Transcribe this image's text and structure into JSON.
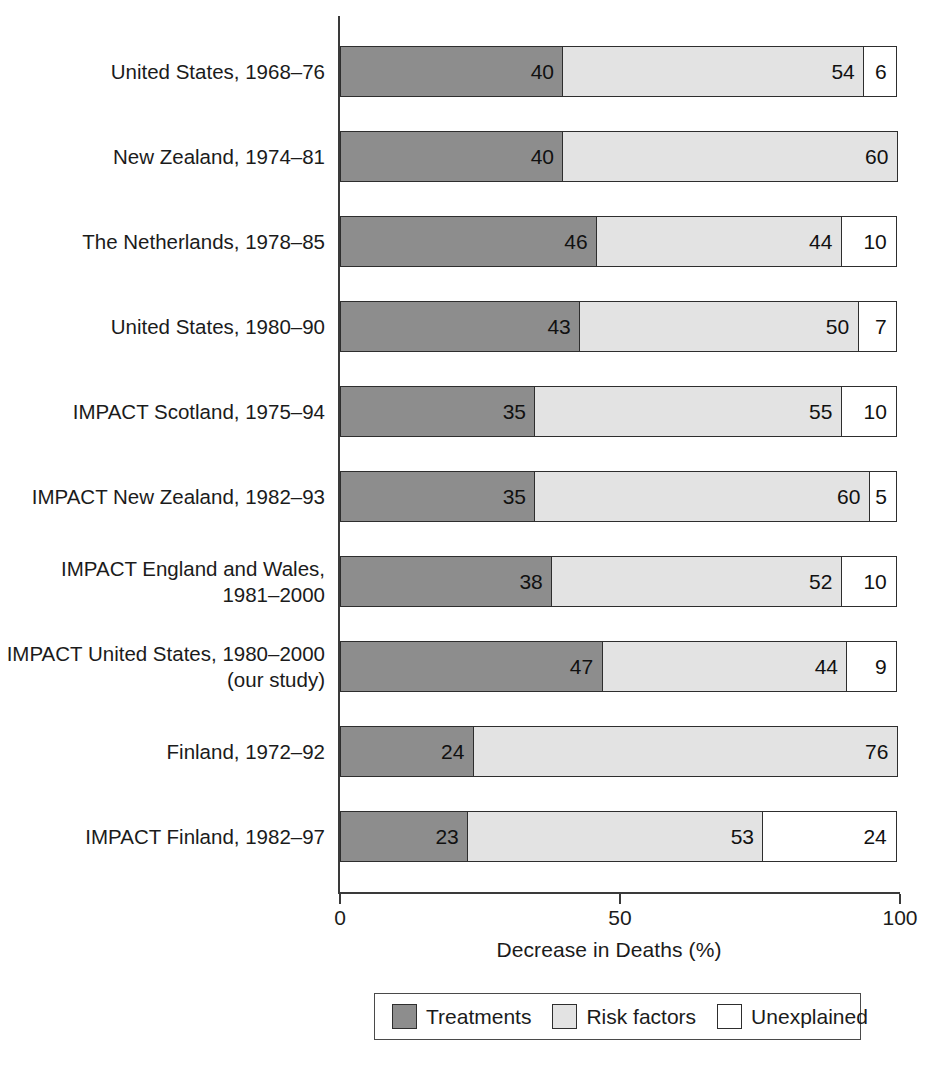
{
  "chart_data": {
    "type": "bar",
    "subtype": "stacked-horizontal-100",
    "title": "",
    "xlabel": "Decrease in Deaths (%)",
    "ylabel": "",
    "xlim": [
      0,
      100
    ],
    "xticks": [
      0,
      50,
      100
    ],
    "xtick_labels": [
      "0",
      "50",
      "100"
    ],
    "grid": false,
    "legend_position": "bottom",
    "categories": [
      "United States, 1968–76",
      "New Zealand, 1974–81",
      "The Netherlands, 1978–85",
      "United States, 1980–90",
      "IMPACT Scotland, 1975–94",
      "IMPACT New Zealand, 1982–93",
      "IMPACT England and Wales,\n1981–2000",
      "IMPACT United States, 1980–2000\n(our study)",
      "Finland, 1972–92",
      "IMPACT Finland, 1982–97"
    ],
    "series": [
      {
        "name": "Treatments",
        "color": "#8d8d8d",
        "values": [
          40,
          40,
          46,
          43,
          35,
          35,
          38,
          47,
          24,
          23
        ]
      },
      {
        "name": "Risk factors",
        "color": "#e3e3e3",
        "values": [
          54,
          60,
          44,
          50,
          55,
          60,
          52,
          44,
          76,
          53
        ]
      },
      {
        "name": "Unexplained",
        "color": "#ffffff",
        "values": [
          6,
          0,
          10,
          7,
          10,
          5,
          10,
          9,
          0,
          24
        ]
      }
    ],
    "rows": [
      {
        "label": "United States, 1968–76",
        "segments": [
          {
            "series": "Treatments",
            "value": 40,
            "label": "40"
          },
          {
            "series": "Risk factors",
            "value": 54,
            "label": "54"
          },
          {
            "series": "Unexplained",
            "value": 6,
            "label": "6"
          }
        ]
      },
      {
        "label": "New Zealand, 1974–81",
        "segments": [
          {
            "series": "Treatments",
            "value": 40,
            "label": "40"
          },
          {
            "series": "Risk factors",
            "value": 60,
            "label": "60"
          }
        ]
      },
      {
        "label": "The Netherlands, 1978–85",
        "segments": [
          {
            "series": "Treatments",
            "value": 46,
            "label": "46"
          },
          {
            "series": "Risk factors",
            "value": 44,
            "label": "44"
          },
          {
            "series": "Unexplained",
            "value": 10,
            "label": "10"
          }
        ]
      },
      {
        "label": "United States, 1980–90",
        "segments": [
          {
            "series": "Treatments",
            "value": 43,
            "label": "43"
          },
          {
            "series": "Risk factors",
            "value": 50,
            "label": "50"
          },
          {
            "series": "Unexplained",
            "value": 7,
            "label": "7"
          }
        ]
      },
      {
        "label": "IMPACT Scotland, 1975–94",
        "segments": [
          {
            "series": "Treatments",
            "value": 35,
            "label": "35"
          },
          {
            "series": "Risk factors",
            "value": 55,
            "label": "55"
          },
          {
            "series": "Unexplained",
            "value": 10,
            "label": "10"
          }
        ]
      },
      {
        "label": "IMPACT New Zealand, 1982–93",
        "segments": [
          {
            "series": "Treatments",
            "value": 35,
            "label": "35"
          },
          {
            "series": "Risk factors",
            "value": 60,
            "label": "60"
          },
          {
            "series": "Unexplained",
            "value": 5,
            "label": "5"
          }
        ]
      },
      {
        "label": "IMPACT England and Wales,\n1981–2000",
        "segments": [
          {
            "series": "Treatments",
            "value": 38,
            "label": "38"
          },
          {
            "series": "Risk factors",
            "value": 52,
            "label": "52"
          },
          {
            "series": "Unexplained",
            "value": 10,
            "label": "10"
          }
        ]
      },
      {
        "label": "IMPACT United States, 1980–2000\n(our study)",
        "segments": [
          {
            "series": "Treatments",
            "value": 47,
            "label": "47"
          },
          {
            "series": "Risk factors",
            "value": 44,
            "label": "44"
          },
          {
            "series": "Unexplained",
            "value": 9,
            "label": "9"
          }
        ]
      },
      {
        "label": "Finland, 1972–92",
        "segments": [
          {
            "series": "Treatments",
            "value": 24,
            "label": "24"
          },
          {
            "series": "Risk factors",
            "value": 76,
            "label": "76"
          }
        ]
      },
      {
        "label": "IMPACT Finland, 1982–97",
        "segments": [
          {
            "series": "Treatments",
            "value": 23,
            "label": "23"
          },
          {
            "series": "Risk factors",
            "value": 53,
            "label": "53"
          },
          {
            "series": "Unexplained",
            "value": 24,
            "label": "24"
          }
        ]
      }
    ],
    "legend": [
      {
        "label": "Treatments",
        "color": "#8d8d8d"
      },
      {
        "label": "Risk factors",
        "color": "#e3e3e3"
      },
      {
        "label": "Unexplained",
        "color": "#ffffff"
      }
    ]
  }
}
